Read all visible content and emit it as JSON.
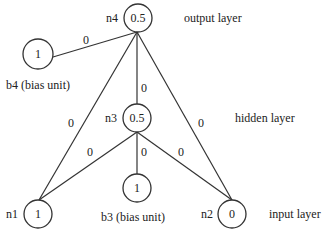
{
  "diagram": {
    "layers": {
      "output": "output layer",
      "hidden": "hidden layer",
      "input": "input layer"
    },
    "nodes": {
      "n4": {
        "name": "n4",
        "value": "0.5"
      },
      "b4": {
        "name": "b4 (bias unit)",
        "value": "1"
      },
      "n3": {
        "name": "n3",
        "value": "0.5"
      },
      "b3": {
        "name": "b3 (bias unit)",
        "value": "1"
      },
      "n1": {
        "name": "n1",
        "value": "1"
      },
      "n2": {
        "name": "n2",
        "value": "0"
      }
    },
    "edges": {
      "b4_n4": "0",
      "n3_n4": "0",
      "n1_n4": "0",
      "n2_n4": "0",
      "n1_n3": "0",
      "b3_n3": "0",
      "n2_n3": "0"
    }
  }
}
